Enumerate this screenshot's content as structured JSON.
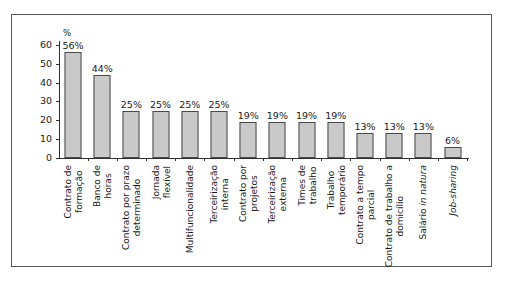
{
  "chart_data": {
    "type": "bar",
    "title": "",
    "subtitle": "",
    "xlabel": "",
    "ylabel": "%",
    "ylim": [
      0,
      60
    ],
    "yticks": [
      0,
      10,
      20,
      30,
      40,
      50,
      60
    ],
    "grid": false,
    "legend": null,
    "bar_color": "#c9c9c9",
    "bar_border_color": "#4a4a4a",
    "axis_color": "#303030",
    "frame_color": "#5a5a5a",
    "categories": [
      "Contrato de formação",
      "Banco de horas",
      "Contrato por prazo determinado",
      "Jornada flexível",
      "Multifuncionalidade",
      "Terceirização interna",
      "Contrato por projetos",
      "Terceirização externa",
      "Times de trabalho",
      "Trabalho temporário",
      "Contrato a tempo parcial",
      "Contrato de trabalho a domicílio",
      "Salário in natura",
      "Job-sharing"
    ],
    "values": [
      56,
      44,
      25,
      25,
      25,
      25,
      19,
      19,
      19,
      19,
      13,
      13,
      13,
      6
    ],
    "data_labels": [
      "56%",
      "44%",
      "25%",
      "25%",
      "25%",
      "25%",
      "19%",
      "19%",
      "19%",
      "19%",
      "13%",
      "13%",
      "13%",
      "6%"
    ],
    "category_lines": [
      [
        "Contrato de",
        "formação"
      ],
      [
        "Banco de",
        "horas"
      ],
      [
        "Contrato por prazo",
        "determinado"
      ],
      [
        "Jornada",
        "flexível"
      ],
      [
        "Multifuncionalidade"
      ],
      [
        "Terceirização",
        "interna"
      ],
      [
        "Contrato por",
        "projetos"
      ],
      [
        "Terceirização",
        "externa"
      ],
      [
        "Times de",
        "trabalho"
      ],
      [
        "Trabalho",
        "temporário"
      ],
      [
        "Contrato a tempo",
        "parcial"
      ],
      [
        "Contrato de trabalho a",
        "domicílio"
      ],
      [
        "Salário in natura"
      ],
      [
        "Job-sharing"
      ]
    ],
    "category_styles": [
      "normal",
      "normal",
      "normal",
      "normal",
      "normal",
      "normal",
      "normal",
      "normal",
      "normal",
      "normal",
      "normal",
      "normal",
      "partial-italic",
      "italic"
    ]
  }
}
